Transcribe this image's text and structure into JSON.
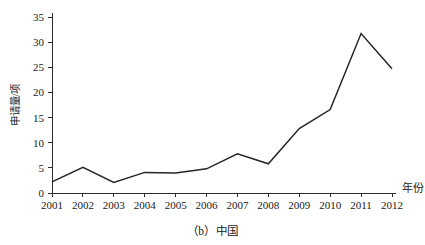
{
  "chart_data": {
    "type": "line",
    "title": "",
    "caption": "（b）中国",
    "xlabel": "年份",
    "ylabel": "申请量/项",
    "categories": [
      "2001",
      "2002",
      "2003",
      "2004",
      "2005",
      "2006",
      "2007",
      "2008",
      "2009",
      "2010",
      "2011",
      "2012"
    ],
    "x": [
      2001,
      2002,
      2003,
      2004,
      2005,
      2006,
      2007,
      2008,
      2009,
      2010,
      2011,
      2012
    ],
    "values": [
      2.2,
      5.1,
      2.1,
      4.1,
      4.0,
      4.8,
      7.8,
      5.8,
      12.8,
      16.6,
      31.7,
      24.7
    ],
    "series": [
      {
        "name": "中国",
        "values": [
          2.2,
          5.1,
          2.1,
          4.1,
          4.0,
          4.8,
          7.8,
          5.8,
          12.8,
          16.6,
          31.7,
          24.7
        ]
      }
    ],
    "ylim": [
      0,
      35
    ],
    "yticks": [
      0,
      5,
      10,
      15,
      20,
      25,
      30,
      35
    ],
    "ytick_labels": [
      "0",
      "5",
      "10",
      "15",
      "20",
      "25",
      "30",
      "35"
    ],
    "xtick_labels": [
      "2001",
      "2002",
      "2003",
      "2004",
      "2005",
      "2006",
      "2007",
      "2008",
      "2009",
      "2010",
      "2011",
      "2012"
    ],
    "grid": false,
    "legend": false,
    "line_color": "#262626",
    "axis_color": "#2b2b2b",
    "background_color": "#ffffff"
  }
}
